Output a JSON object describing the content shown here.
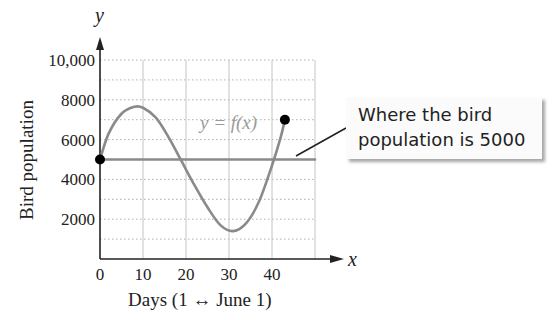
{
  "chart_data": {
    "type": "line",
    "title": "",
    "xlabel": "Days (1 ↔ June 1)",
    "ylabel": "Bird population",
    "x_axis_var": "x",
    "y_axis_var": "y",
    "xlim": [
      0,
      50
    ],
    "ylim": [
      0,
      10000
    ],
    "x_ticks": [
      "0",
      "10",
      "20",
      "30",
      "40"
    ],
    "y_ticks": [
      "2000",
      "4000",
      "6000",
      "8000",
      "10,000"
    ],
    "grid": true,
    "series": [
      {
        "name": "y = f(x)",
        "color": "#8a8a8a",
        "x": [
          0,
          2,
          5,
          8,
          10,
          13,
          16,
          19,
          22,
          25,
          28,
          31,
          34,
          37,
          40,
          42,
          43
        ],
        "y": [
          5000,
          6300,
          7300,
          7650,
          7600,
          7100,
          6100,
          4900,
          3700,
          2600,
          1700,
          1400,
          1800,
          2900,
          4700,
          6100,
          7000
        ]
      },
      {
        "name": "y = 5000",
        "color": "#8a8a8a",
        "x": [
          0,
          50
        ],
        "y": [
          5000,
          5000
        ]
      }
    ],
    "points": [
      {
        "x": 0,
        "y": 5000,
        "color": "#000000"
      },
      {
        "x": 43,
        "y": 7000,
        "color": "#000000"
      }
    ],
    "annotations": [
      {
        "text": "y = f(x)",
        "x": 23,
        "y": 6400
      },
      {
        "text": "Where the bird population is 5000",
        "points_to": {
          "x": 48,
          "y": 5000
        }
      }
    ]
  },
  "labels": {
    "curve_label": "y = f(x)",
    "x_var": "x",
    "y_var": "y",
    "xlabel": "Days (1 ↔ June 1)",
    "ylabel": "Bird population",
    "callout_line1": "Where the bird",
    "callout_line2": "population is 5000"
  }
}
